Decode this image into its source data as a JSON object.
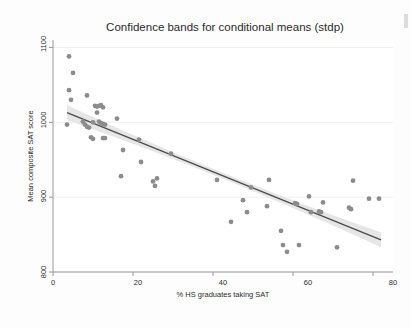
{
  "chart_data": {
    "type": "scatter",
    "title": "Confidence bands for conditional means (stdp)",
    "xlabel": "% HS graduates taking SAT",
    "ylabel": "Mean composite SAT score",
    "xlim": [
      0,
      85
    ],
    "ylim": [
      800,
      1110
    ],
    "xticks": [
      0,
      20,
      40,
      60,
      80
    ],
    "yticks": [
      800,
      900,
      1000,
      1100
    ],
    "xtick_labels": [
      "0",
      "20",
      "40",
      "60",
      "80"
    ],
    "ytick_labels": [
      "800",
      "900",
      "1000",
      "1100"
    ],
    "grid": true,
    "legend": "none",
    "marker_color": "#8c8c8c",
    "line_color": "#4a4a4a",
    "band_color": "#e2e2e2",
    "points": [
      {
        "x": 4.0,
        "y": 1088
      },
      {
        "x": 5.0,
        "y": 1066
      },
      {
        "x": 4.0,
        "y": 1043
      },
      {
        "x": 4.5,
        "y": 1030
      },
      {
        "x": 3.5,
        "y": 997
      },
      {
        "x": 8.5,
        "y": 1036
      },
      {
        "x": 10.5,
        "y": 1022
      },
      {
        "x": 11.0,
        "y": 1021
      },
      {
        "x": 11.5,
        "y": 1022
      },
      {
        "x": 12.0,
        "y": 1023
      },
      {
        "x": 12.5,
        "y": 1020
      },
      {
        "x": 11.0,
        "y": 1013
      },
      {
        "x": 7.5,
        "y": 1001
      },
      {
        "x": 8.0,
        "y": 997
      },
      {
        "x": 8.5,
        "y": 994
      },
      {
        "x": 9.0,
        "y": 993
      },
      {
        "x": 10.0,
        "y": 1000
      },
      {
        "x": 11.5,
        "y": 1001
      },
      {
        "x": 12.0,
        "y": 999
      },
      {
        "x": 12.5,
        "y": 998
      },
      {
        "x": 13.0,
        "y": 997
      },
      {
        "x": 9.5,
        "y": 980
      },
      {
        "x": 10.0,
        "y": 978
      },
      {
        "x": 12.5,
        "y": 979
      },
      {
        "x": 13.0,
        "y": 979
      },
      {
        "x": 16.0,
        "y": 1005
      },
      {
        "x": 17.5,
        "y": 963
      },
      {
        "x": 21.5,
        "y": 977
      },
      {
        "x": 22.0,
        "y": 947
      },
      {
        "x": 17.0,
        "y": 928
      },
      {
        "x": 25.0,
        "y": 921
      },
      {
        "x": 26.0,
        "y": 925
      },
      {
        "x": 25.5,
        "y": 915
      },
      {
        "x": 29.5,
        "y": 958
      },
      {
        "x": 41.0,
        "y": 923
      },
      {
        "x": 44.5,
        "y": 867
      },
      {
        "x": 47.5,
        "y": 896
      },
      {
        "x": 48.5,
        "y": 880
      },
      {
        "x": 49.5,
        "y": 913
      },
      {
        "x": 53.5,
        "y": 888
      },
      {
        "x": 54.0,
        "y": 923
      },
      {
        "x": 57.0,
        "y": 855
      },
      {
        "x": 57.5,
        "y": 836
      },
      {
        "x": 58.5,
        "y": 827
      },
      {
        "x": 60.5,
        "y": 892
      },
      {
        "x": 61.0,
        "y": 891
      },
      {
        "x": 61.5,
        "y": 836
      },
      {
        "x": 64.0,
        "y": 901
      },
      {
        "x": 64.5,
        "y": 880
      },
      {
        "x": 66.5,
        "y": 881
      },
      {
        "x": 67.0,
        "y": 880
      },
      {
        "x": 67.5,
        "y": 893
      },
      {
        "x": 71.0,
        "y": 833
      },
      {
        "x": 74.0,
        "y": 886
      },
      {
        "x": 74.5,
        "y": 884
      },
      {
        "x": 75.0,
        "y": 922
      },
      {
        "x": 79.0,
        "y": 898
      },
      {
        "x": 81.5,
        "y": 898
      }
    ],
    "fit_line": {
      "description": "linear regression of mean composite SAT score on % HS graduates taking SAT",
      "x_start": 3.5,
      "y_start": 1013,
      "x_end": 82.0,
      "y_end": 843
    },
    "confidence_band": {
      "description": "confidence band for conditional means (stdp)",
      "x_start": 3.5,
      "x_end": 82.0,
      "half_width_at_start": 10,
      "half_width_at_center": 4,
      "half_width_at_end": 10
    }
  }
}
